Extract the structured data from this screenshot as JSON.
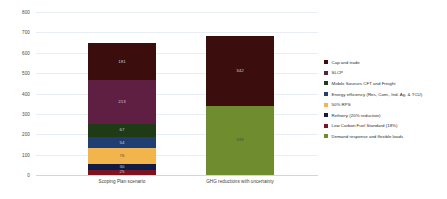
{
  "chart_data": {
    "type": "bar",
    "title": "",
    "subtitle": "",
    "xlabel": "",
    "ylabel": "",
    "ylim": [
      0,
      800
    ],
    "ytick_labels": [
      "800",
      "700",
      "600",
      "500",
      "400",
      "300",
      "200",
      "100",
      "0"
    ],
    "ytick_values": [
      800,
      700,
      600,
      500,
      400,
      300,
      200,
      100,
      0
    ],
    "grid": true,
    "stacked": true,
    "legend_position": "right",
    "categories": [
      "Scoping Plan scenario",
      "GHG reductions with uncertainty"
    ],
    "series": [
      {
        "name": "Cap and trade",
        "color": "#3b0d0d",
        "values": [
          181,
          342
        ]
      },
      {
        "name": "SLCP",
        "color": "#5e1f43",
        "values": [
          213,
          0
        ]
      },
      {
        "name": "Mobile Sources CFT and Freight",
        "color": "#1f3b16",
        "values": [
          67,
          0
        ]
      },
      {
        "name": "Energy efficiency (Res, Com., Ind. Ag. & TCU)",
        "color": "#1f3f73",
        "values": [
          54,
          0
        ]
      },
      {
        "name": "50% RPS",
        "color": "#f2b44c",
        "values": [
          76,
          0
        ]
      },
      {
        "name": "Refinery (20% reduction)",
        "color": "#101c47",
        "values": [
          30,
          0
        ]
      },
      {
        "name": "Low Carbon Fuel Standard (18%)",
        "color": "#7d1220",
        "values": [
          25,
          0
        ]
      },
      {
        "name": "Demand response and flexible loads",
        "color": "#6f8c2f",
        "values": [
          0,
          339
        ]
      }
    ],
    "bar_totals": [
      646,
      681
    ],
    "data_labels": {
      "bar1": [
        "181",
        "213",
        "67",
        "54",
        "76",
        "30",
        "25"
      ],
      "bar2": [
        "342",
        "339"
      ]
    }
  },
  "legend": {
    "items": [
      {
        "label": "Cap and trade",
        "color": "#3b0d0d"
      },
      {
        "label": "SLCP",
        "color": "#5e1f43"
      },
      {
        "label": "Mobile Sources CFT and Freight",
        "color": "#1f3b16"
      },
      {
        "label": "Energy efficiency (Res, Com., Ind. Ag. & TCU)",
        "color": "#1f3f73"
      },
      {
        "label": "50% RPS",
        "color": "#f2b44c"
      },
      {
        "label": "Refinery (20% reduction)",
        "color": "#101c47"
      },
      {
        "label": "Low Carbon Fuel Standard (18%)",
        "color": "#7d1220"
      },
      {
        "label": "Demand response and flexible loads",
        "color": "#6f8c2f"
      }
    ]
  }
}
